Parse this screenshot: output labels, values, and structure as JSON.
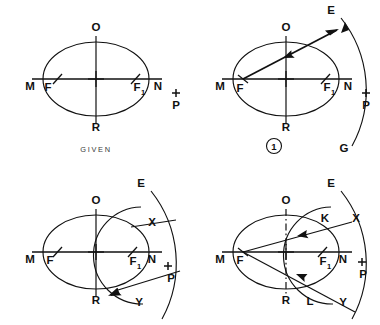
{
  "figure": {
    "ink_color": "#111111",
    "background_color": "#ffffff",
    "panel_count": 4
  },
  "panels": [
    {
      "id": "panel-given",
      "caption": "GIVEN",
      "step_number": "",
      "labels": {
        "major_left": "M",
        "focus_left": "F",
        "focus_right": "F",
        "focus_right_sub": "1",
        "major_right": "N",
        "minor_top": "O",
        "minor_bottom": "R",
        "external_point": "P"
      }
    },
    {
      "id": "panel-1",
      "caption": "",
      "step_number": "1",
      "labels": {
        "major_left": "M",
        "focus_left": "F",
        "focus_right": "F",
        "focus_right_sub": "1",
        "major_right": "N",
        "minor_top": "O",
        "minor_bottom": "R",
        "external_point": "P",
        "arc_top": "E",
        "arc_bottom": "G"
      }
    },
    {
      "id": "panel-2",
      "caption": "",
      "step_number": "",
      "labels": {
        "major_left": "M",
        "focus_left": "F",
        "focus_right": "F",
        "focus_right_sub": "1",
        "major_right": "N",
        "minor_top": "O",
        "minor_bottom": "R",
        "external_point": "P",
        "arc_top": "E",
        "intersect_upper": "X",
        "intersect_lower": "Y"
      }
    },
    {
      "id": "panel-3",
      "caption": "",
      "step_number": "",
      "labels": {
        "major_left": "M",
        "focus_left": "F",
        "focus_right": "F",
        "focus_right_sub": "1",
        "major_right": "N",
        "minor_top": "O",
        "minor_bottom": "R",
        "external_point": "P",
        "arc_top": "E",
        "intersect_upper": "X",
        "intersect_lower": "Y",
        "tangent_point_upper": "K",
        "tangent_point_lower": "L"
      }
    }
  ]
}
